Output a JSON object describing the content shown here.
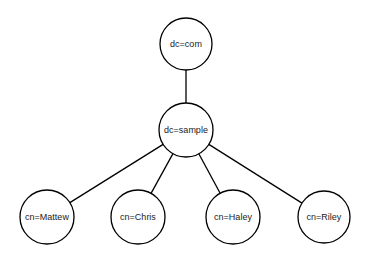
{
  "diagram": {
    "type": "tree",
    "nodes": [
      {
        "id": "com",
        "label": "dc=com",
        "cx": 186,
        "cy": 44,
        "r": 26
      },
      {
        "id": "sample",
        "label": "dc=sample",
        "cx": 186,
        "cy": 130,
        "r": 27
      },
      {
        "id": "mattew",
        "label": "cn=Mattew",
        "cx": 47,
        "cy": 217,
        "r": 27
      },
      {
        "id": "chris",
        "label": "cn=Chris",
        "cx": 138,
        "cy": 217,
        "r": 27
      },
      {
        "id": "haley",
        "label": "cn=Haley",
        "cx": 233,
        "cy": 217,
        "r": 27
      },
      {
        "id": "riley",
        "label": "cn=Riley",
        "cx": 324,
        "cy": 217,
        "r": 26
      }
    ],
    "edges": [
      {
        "from": "com",
        "to": "sample"
      },
      {
        "from": "sample",
        "to": "mattew"
      },
      {
        "from": "sample",
        "to": "chris"
      },
      {
        "from": "sample",
        "to": "haley"
      },
      {
        "from": "sample",
        "to": "riley"
      }
    ],
    "stroke_color": "#000000",
    "fill_color": "#ffffff"
  }
}
